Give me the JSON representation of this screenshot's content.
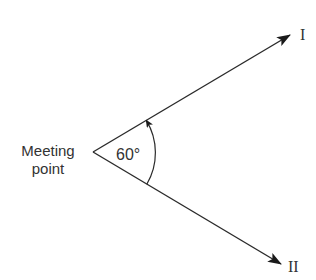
{
  "diagram": {
    "origin_label_line1": "Meeting",
    "origin_label_line2": "point",
    "angle_label": "60°",
    "ray_upper_label": "I",
    "ray_lower_label": "II",
    "line_color": "#222222",
    "text_color": "#333333"
  }
}
